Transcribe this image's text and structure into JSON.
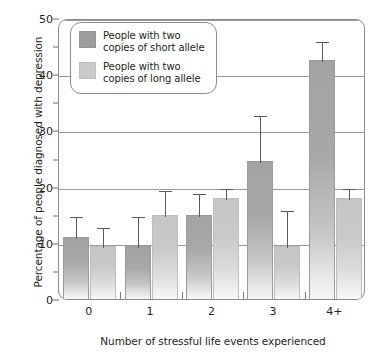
{
  "chart_data": {
    "type": "bar",
    "title": "",
    "xlabel": "Number of stressful life events experienced",
    "ylabel": "Percentage of people diagnosed with depression",
    "categories": [
      "0",
      "1",
      "2",
      "3",
      "4+"
    ],
    "ylim": [
      0,
      50
    ],
    "yticks": [
      0,
      10,
      20,
      30,
      40,
      50
    ],
    "ytick_labels": [
      "0",
      "10",
      "20",
      "30",
      "40",
      "50"
    ],
    "yticks_minor": [
      5,
      15,
      25,
      35,
      45
    ],
    "grid": true,
    "legend_position": "upper left",
    "series": [
      {
        "name": "People with two copies of short allele",
        "color": "#9d9d9d",
        "values": [
          11.0,
          9.5,
          15.0,
          24.5,
          42.5
        ],
        "errors_upper": [
          15.0,
          15.0,
          19.0,
          33.0,
          46.0
        ]
      },
      {
        "name": "People with two copies of long allele",
        "color": "#cacaca",
        "values": [
          9.5,
          15.0,
          18.0,
          9.5,
          18.0
        ],
        "errors_upper": [
          13.0,
          19.5,
          20.0,
          16.0,
          20.0
        ]
      }
    ]
  },
  "legend": {
    "items": [
      {
        "label_line1": "People with two",
        "label_line2": "copies of short allele"
      },
      {
        "label_line1": "People with two",
        "label_line2": "copies of long allele"
      }
    ]
  }
}
